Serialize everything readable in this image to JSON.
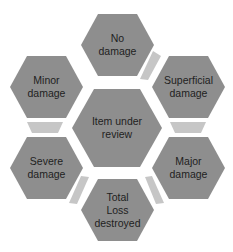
{
  "diagram": {
    "type": "hexagon-cycle",
    "colors": {
      "hexagon": "#8e8e8e",
      "connector": "#c6c6c6",
      "text": "#1e1e1e",
      "background": "#ffffff"
    },
    "center": {
      "label": "Item under\nreview"
    },
    "nodes": [
      {
        "position": "top",
        "label": "No\ndamage"
      },
      {
        "position": "top-right",
        "label": "Superficial\ndamage"
      },
      {
        "position": "bottom-right",
        "label": "Major\ndamage"
      },
      {
        "position": "bottom",
        "label": "Total\nLoss\ndestroyed"
      },
      {
        "position": "bottom-left",
        "label": "Severe\ndamage"
      },
      {
        "position": "top-left",
        "label": "Minor\ndamage"
      }
    ],
    "connectors": [
      {
        "from": "No damage",
        "to": "Superficial damage"
      },
      {
        "from": "Superficial damage",
        "to": "Major damage"
      },
      {
        "from": "Major damage",
        "to": "Total Loss destroyed"
      },
      {
        "from": "Total Loss destroyed",
        "to": "Severe damage"
      },
      {
        "from": "Severe damage",
        "to": "Minor damage"
      }
    ]
  }
}
